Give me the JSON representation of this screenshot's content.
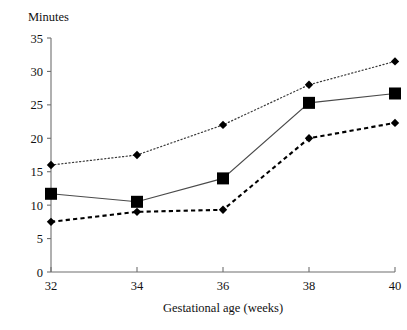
{
  "chart_data": {
    "type": "line",
    "title": "",
    "xlabel": "Gestational age (weeks)",
    "ylabel": "Minutes",
    "x": [
      32,
      34,
      36,
      38,
      40
    ],
    "xticklabels": [
      "32",
      "34",
      "36",
      "38",
      "40"
    ],
    "yticklabels": [
      "0",
      "5",
      "10",
      "15",
      "20",
      "25",
      "30",
      "35"
    ],
    "yticks": [
      0,
      5,
      10,
      15,
      20,
      25,
      30,
      35
    ],
    "xlim": [
      32,
      40
    ],
    "ylim": [
      0,
      35
    ],
    "grid": false,
    "legend": "none",
    "series": [
      {
        "name": "upper-dotted-series",
        "marker": "diamond",
        "linestyle": "dotted",
        "color": "#000000",
        "values": [
          16,
          17.5,
          22,
          28,
          31.5
        ]
      },
      {
        "name": "middle-solid-series",
        "marker": "square",
        "linestyle": "solid",
        "color": "#000000",
        "values": [
          11.7,
          10.5,
          14,
          25.3,
          26.7
        ]
      },
      {
        "name": "lower-dashed-series",
        "marker": "diamond",
        "linestyle": "dashed",
        "color": "#000000",
        "values": [
          7.5,
          9,
          9.3,
          20,
          22.3
        ]
      }
    ]
  }
}
